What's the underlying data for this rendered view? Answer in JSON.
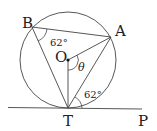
{
  "diagram": {
    "type": "circle-tangent-geometry",
    "points": {
      "B": {
        "label": "B"
      },
      "A": {
        "label": "A"
      },
      "O": {
        "label": "O"
      },
      "T": {
        "label": "T"
      },
      "P": {
        "label": "P"
      }
    },
    "angles": {
      "at_B": "62°",
      "at_T_tangent": "62°",
      "at_O": "θ"
    },
    "colors": {
      "stroke": "#333333",
      "text": "#222222",
      "background": "#ffffff"
    }
  }
}
